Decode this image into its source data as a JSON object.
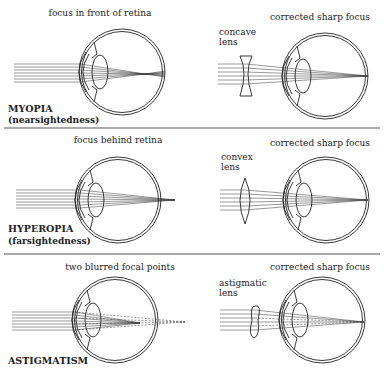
{
  "panels": [
    {
      "condition": "MYOPIA",
      "subtitle": "(nearsightedness)",
      "problem_caption": "focus in front of retina",
      "lens_label_1": "concave",
      "lens_label_2": "lens",
      "corrected_caption": "corrected sharp focus"
    },
    {
      "condition": "HYPEROPIA",
      "subtitle": "(farsightedness)",
      "problem_caption": "focus behind retina",
      "lens_label_1": "convex",
      "lens_label_2": "lens",
      "corrected_caption": "corrected sharp focus"
    },
    {
      "condition": "ASTIGMATISM",
      "subtitle": "",
      "problem_caption": "two blurred focal points",
      "lens_label_1": "astigmatic",
      "lens_label_2": "lens",
      "corrected_caption": "corrected sharp focus"
    }
  ]
}
